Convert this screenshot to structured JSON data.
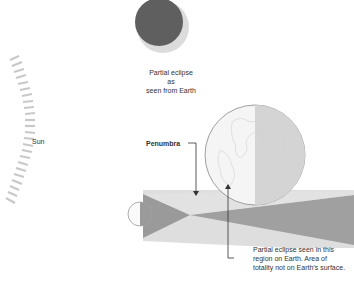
{
  "diagram": {
    "labels": {
      "sun": "Sun",
      "eclipse_view": [
        "Partial eclipse as",
        "seen from Earth"
      ],
      "penumbra": "Penumbra",
      "callout": [
        "Partial eclipse seen in this",
        "region on Earth. Area of",
        "totality not on Earth’s surface."
      ]
    },
    "colors": {
      "moon_dark": "#5f5f5f",
      "sun_disk": "#dcdcdc",
      "penumbra": "#d9d9d9",
      "umbra": "#9a9a9a",
      "earth_outline": "#888888",
      "earth_night": "#d4d4d4"
    }
  }
}
